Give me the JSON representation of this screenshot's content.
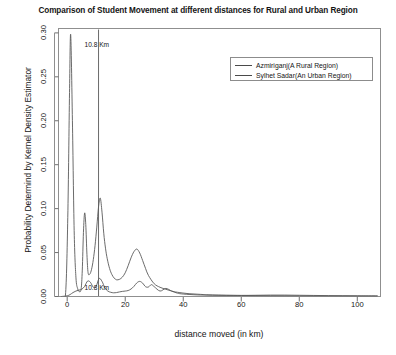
{
  "chart_data": {
    "type": "line",
    "title": "Comparison of Student Movement at different distances for Rural and Urban Region",
    "xlabel": "distance moved  (in km)",
    "ylabel": "Probability Determind by Kernel Density Estimator",
    "xlim": [
      -3,
      108
    ],
    "ylim": [
      0.0,
      0.305
    ],
    "xticks": [
      0,
      20,
      40,
      60,
      80,
      100
    ],
    "xtick_labels": [
      "0",
      "20",
      "40",
      "60",
      "80",
      "100"
    ],
    "yticks": [
      0.0,
      0.05,
      0.1,
      0.15,
      0.2,
      0.25,
      0.3
    ],
    "ytick_labels": [
      "0.00",
      "0.05",
      "0.10",
      "0.15",
      "0.20",
      "0.25",
      "0.30"
    ],
    "grid": false,
    "legend_position": "top-right",
    "box_frame": true,
    "annotations": [
      {
        "text": "10.8 Km",
        "x": 10.8,
        "y": 0.286,
        "name": "upper-10-8-km-label"
      },
      {
        "text": "10.8 Km",
        "x": 10.8,
        "y": 0.0095,
        "name": "lower-10-8-km-label"
      }
    ],
    "reference_lines": [
      {
        "orientation": "vertical",
        "x": 10.8,
        "color": "#6b6b6b",
        "name": "reference-line-10-8-km"
      }
    ],
    "series": [
      {
        "name": "Azmiriganj(A Rural Region)",
        "color": "#5a5a5a",
        "points_x": [
          -2.0,
          0.0,
          1.0,
          2.0,
          3.0,
          4.0,
          5.0,
          6.0,
          7.0,
          8.0,
          9.0,
          10.0,
          11.0,
          12.0,
          13.0,
          14.0,
          15.0,
          16.0,
          17.0,
          18.0,
          19.0,
          20.0,
          21.0,
          22.0,
          23.0,
          24.0,
          25.0,
          26.0,
          27.0,
          28.0,
          29.0,
          30.0,
          32.0,
          34.0,
          36.0,
          38.0,
          40.0,
          45.0,
          50.0,
          55.0,
          60.0,
          65.0,
          70.0,
          75.0,
          80.0,
          85.0,
          90.0,
          95.0,
          100.0,
          105.0,
          107.0
        ],
        "points_y": [
          0.0,
          0.0008,
          0.0022,
          0.0045,
          0.0062,
          0.0072,
          0.0082,
          0.0115,
          0.0175,
          0.0162,
          0.0105,
          0.0118,
          0.0205,
          0.0172,
          0.0098,
          0.0062,
          0.0048,
          0.0042,
          0.0045,
          0.0052,
          0.0058,
          0.0062,
          0.0068,
          0.0085,
          0.0115,
          0.0155,
          0.0172,
          0.0152,
          0.0112,
          0.0108,
          0.0135,
          0.0112,
          0.0062,
          0.0092,
          0.0062,
          0.0038,
          0.0028,
          0.0018,
          0.0014,
          0.0012,
          0.0012,
          0.0014,
          0.0016,
          0.0016,
          0.0014,
          0.0012,
          0.001,
          0.0009,
          0.0008,
          0.0007,
          0.0007
        ]
      },
      {
        "name": "Sylhet Sadar(An Urban Region)",
        "color": "#5a5a5a",
        "points_x": [
          -2.0,
          -0.6,
          0.2,
          0.8,
          1.2,
          1.8,
          2.4,
          3.0,
          3.6,
          4.2,
          4.8,
          5.2,
          5.6,
          6.0,
          6.4,
          6.8,
          7.2,
          7.8,
          8.4,
          9.0,
          9.6,
          10.2,
          10.8,
          11.4,
          12.0,
          12.6,
          13.2,
          13.8,
          14.6,
          15.4,
          16.2,
          17.0,
          18.0,
          19.0,
          20.0,
          21.0,
          22.0,
          23.0,
          24.0,
          25.0,
          26.0,
          27.0,
          28.0,
          30.0,
          32.0,
          34.0,
          36.0,
          38.0,
          42.0,
          46.0,
          50.0,
          60.0,
          70.0,
          80.0,
          90.0,
          100.0,
          107.0
        ],
        "points_y": [
          0.0,
          0.0015,
          0.09,
          0.232,
          0.298,
          0.2,
          0.075,
          0.022,
          0.009,
          0.0055,
          0.0085,
          0.03,
          0.073,
          0.095,
          0.082,
          0.048,
          0.027,
          0.0255,
          0.031,
          0.042,
          0.058,
          0.079,
          0.102,
          0.112,
          0.096,
          0.072,
          0.055,
          0.043,
          0.032,
          0.025,
          0.021,
          0.019,
          0.0195,
          0.022,
          0.027,
          0.035,
          0.044,
          0.051,
          0.054,
          0.0495,
          0.041,
          0.032,
          0.024,
          0.0145,
          0.0105,
          0.0082,
          0.0062,
          0.0048,
          0.0032,
          0.0024,
          0.0018,
          0.0012,
          0.0009,
          0.0007,
          0.0006,
          0.0005,
          0.0005
        ]
      }
    ]
  }
}
